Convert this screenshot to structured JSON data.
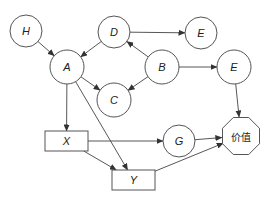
{
  "diagram": {
    "type": "influence-diagram",
    "colors": {
      "stroke": "#555555",
      "edge": "#444444",
      "fill": "#ffffff",
      "text": "#222222"
    },
    "nodes": [
      {
        "id": "H",
        "label": "H",
        "shape": "circle",
        "cx": 26,
        "cy": 31,
        "r": 16
      },
      {
        "id": "D",
        "label": "D",
        "shape": "circle",
        "cx": 114,
        "cy": 32,
        "r": 16
      },
      {
        "id": "E1",
        "label": "E",
        "shape": "circle",
        "cx": 201,
        "cy": 33,
        "r": 16
      },
      {
        "id": "A",
        "label": "A",
        "shape": "circle",
        "cx": 67,
        "cy": 67,
        "r": 17
      },
      {
        "id": "B",
        "label": "B",
        "shape": "circle",
        "cx": 162,
        "cy": 67,
        "r": 17
      },
      {
        "id": "E2",
        "label": "E",
        "shape": "circle",
        "cx": 234,
        "cy": 67,
        "r": 17
      },
      {
        "id": "C",
        "label": "C",
        "shape": "circle",
        "cx": 114,
        "cy": 100,
        "r": 17
      },
      {
        "id": "X",
        "label": "X",
        "shape": "rect",
        "x": 45,
        "y": 131,
        "w": 43,
        "h": 20
      },
      {
        "id": "G",
        "label": "G",
        "shape": "circle",
        "cx": 179,
        "cy": 141,
        "r": 16
      },
      {
        "id": "V",
        "label": "价值",
        "shape": "octagon",
        "cx": 241,
        "cy": 136,
        "r": 20
      },
      {
        "id": "Y",
        "label": "Y",
        "shape": "rect",
        "x": 112,
        "y": 170,
        "w": 43,
        "h": 20
      }
    ],
    "edges": [
      {
        "from": "H",
        "to": "A"
      },
      {
        "from": "D",
        "to": "A"
      },
      {
        "from": "D",
        "to": "E1"
      },
      {
        "from": "B",
        "to": "D"
      },
      {
        "from": "B",
        "to": "C"
      },
      {
        "from": "B",
        "to": "E2"
      },
      {
        "from": "A",
        "to": "C"
      },
      {
        "from": "A",
        "to": "X"
      },
      {
        "from": "A",
        "to": "Y"
      },
      {
        "from": "X",
        "to": "G"
      },
      {
        "from": "X",
        "to": "Y"
      },
      {
        "from": "G",
        "to": "V"
      },
      {
        "from": "E2",
        "to": "V"
      },
      {
        "from": "Y",
        "to": "V"
      }
    ]
  }
}
